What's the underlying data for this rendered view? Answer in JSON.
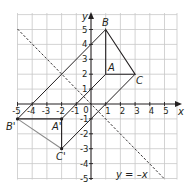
{
  "diagram": {
    "type": "coordinate-plane-transformation",
    "axes": {
      "x_label": "x",
      "y_label": "y",
      "x_range": [
        -5,
        5.8
      ],
      "y_range": [
        -5,
        5.8
      ],
      "origin_label": "0",
      "x_ticks": [
        "-5",
        "-4",
        "-3",
        "-2",
        "-1",
        "1",
        "2",
        "3",
        "4",
        "5"
      ],
      "y_ticks": [
        "5",
        "4",
        "3",
        "2",
        "1",
        "-1",
        "-2",
        "-3",
        "-4",
        "-5"
      ]
    },
    "shapes": {
      "triangle_original": {
        "label": "ABC",
        "vertices": [
          {
            "name": "A",
            "x": 1,
            "y": 2
          },
          {
            "name": "B",
            "x": 1,
            "y": 5
          },
          {
            "name": "C",
            "x": 3,
            "y": 2
          }
        ],
        "color": "#231f20"
      },
      "triangle_image": {
        "label": "A'B'C'",
        "vertices": [
          {
            "name": "A'",
            "x": -2,
            "y": -1
          },
          {
            "name": "B'",
            "x": -5,
            "y": -1
          },
          {
            "name": "C'",
            "x": -2,
            "y": -3
          }
        ],
        "color": "#231f20",
        "edge_BC_color": "#8a8a8a"
      }
    },
    "mirror_line": {
      "label": "y = –x",
      "equation": "y = -x",
      "style": "dashed"
    },
    "labels": {
      "A": "A",
      "B": "B",
      "C": "C",
      "A_prime": "A'",
      "B_prime": "B'",
      "C_prime": "C'"
    },
    "colors": {
      "grid": "#c8c8c8",
      "axes": "#231f20",
      "lines": "#231f20"
    }
  }
}
